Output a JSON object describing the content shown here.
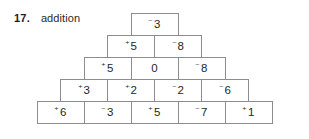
{
  "exercise": {
    "number": "17.",
    "title": "addition"
  },
  "colors": {
    "background": "#ffffff",
    "cell_border": "#8d8d8d",
    "text": "#1f1f1f",
    "label_text": "#1b1b1b"
  },
  "pyramid": {
    "type": "addition-pyramid",
    "row_count": 5,
    "rows": [
      {
        "index": 1,
        "cells": [
          {
            "sign": "⁻",
            "magnitude": "3",
            "value": -3,
            "text": "⁻3"
          }
        ]
      },
      {
        "index": 2,
        "cells": [
          {
            "sign": "⁺",
            "magnitude": "5",
            "value": 5,
            "text": "⁺5"
          },
          {
            "sign": "⁻",
            "magnitude": "8",
            "value": -8,
            "text": "⁻8"
          }
        ]
      },
      {
        "index": 3,
        "cells": [
          {
            "sign": "⁺",
            "magnitude": "5",
            "value": 5,
            "text": "⁺5"
          },
          {
            "sign": "",
            "magnitude": "0",
            "value": 0,
            "text": "0"
          },
          {
            "sign": "⁻",
            "magnitude": "8",
            "value": -8,
            "text": "⁻8"
          }
        ]
      },
      {
        "index": 4,
        "cells": [
          {
            "sign": "⁺",
            "magnitude": "3",
            "value": 3,
            "text": "⁺3"
          },
          {
            "sign": "⁺",
            "magnitude": "2",
            "value": 2,
            "text": "⁺2"
          },
          {
            "sign": "⁻",
            "magnitude": "2",
            "value": -2,
            "text": "⁻2"
          },
          {
            "sign": "⁻",
            "magnitude": "6",
            "value": -6,
            "text": "⁻6"
          }
        ]
      },
      {
        "index": 5,
        "cells": [
          {
            "sign": "⁺",
            "magnitude": "6",
            "value": 6,
            "text": "⁺6"
          },
          {
            "sign": "⁻",
            "magnitude": "3",
            "value": -3,
            "text": "⁻3"
          },
          {
            "sign": "⁺",
            "magnitude": "5",
            "value": 5,
            "text": "⁺5"
          },
          {
            "sign": "⁻",
            "magnitude": "7",
            "value": -7,
            "text": "⁻7"
          },
          {
            "sign": "⁺",
            "magnitude": "1",
            "value": 1,
            "text": "⁺1"
          }
        ]
      }
    ]
  }
}
